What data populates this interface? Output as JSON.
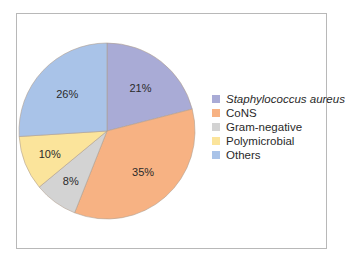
{
  "chart_data": {
    "type": "pie",
    "title": "",
    "categories": [
      "Staphylococcus aureus",
      "CoNS",
      "Gram-negative",
      "Polymicrobial",
      "Others"
    ],
    "values": [
      21,
      35,
      8,
      10,
      26
    ],
    "labels": [
      "21%",
      "35%",
      "8%",
      "10%",
      "26%"
    ],
    "colors": [
      "#a9abd6",
      "#f7b283",
      "#d3d3d3",
      "#fbe49b",
      "#a9c3e8"
    ],
    "start_angle_deg": 0,
    "direction": "clockwise",
    "legend_position": "right",
    "legend": [
      {
        "label": "Staphylococcus aureus",
        "italic": true,
        "color": "#a9abd6"
      },
      {
        "label": "CoNS",
        "italic": false,
        "color": "#f7b283"
      },
      {
        "label": "Gram-negative",
        "italic": false,
        "color": "#d3d3d3"
      },
      {
        "label": "Polymicrobial",
        "italic": false,
        "color": "#fbe49b"
      },
      {
        "label": "Others",
        "italic": false,
        "color": "#a9c3e8"
      }
    ]
  }
}
